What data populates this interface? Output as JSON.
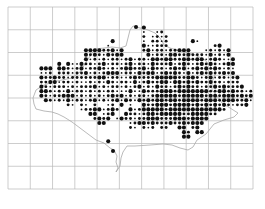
{
  "map": {
    "type": "tetrad-distribution-dot-map",
    "grid": {
      "left": 8,
      "top": 7,
      "right": 253,
      "bottom": 189,
      "columns": 11,
      "rows": 8,
      "line_color": "#b8b8b8",
      "subdivisions_per_square": 5
    },
    "outline_color": "#a8a8a8",
    "dot_color": "#111111",
    "dot_sizes": {
      "s": 0.9,
      "m": 1.45,
      "l": 2.05
    },
    "dot_origin_row": 4,
    "dot_rows": [
      "..............................l.........................",
      "..............................s..sm.....................",
      "..............................m.smsm....................",
      ".......................l......s.mmsm.....ls.............",
      "......................s.......lssmmm..........ml........",
      ".................llllmmlsl....mlsmmsmmlll...smsmsl......",
      ".................lmlmslmll.....lsmmsllmmlmmmslsmsl......",
      ".................lsmsmsmmsmlsmmsllmllmmllmllsmlmssl.....",
      "...........l.lsslmmsmlsmmsmlsmmslmmmlsmlmsmlmlmsmll.....",
      ".......lll.llmsmlsmmlmsmsmllmmlslmmsmlmlsmlmlmlmsms.....",
      ".......ssm.mmmsmmlsmsmlllsmmslmllsmlmlmslsmlmlmmlml.....",
      ".......lmmlmmsmmmmmmllsmmssmlmmmmlllllmmllmsmlsmmsml....",
      ".......mmllsmmsmssmsmslmsmmslsmlmmllsllmlmlmmlmmsmmm....",
      ".......lmsmmmsmsmmmlsmsmmsmsmlsmslmmsmlmlmmsmmlmlmmml...",
      ".......llmsmslsmmsmsmsmmssslsslmmmlllmlllllllmmllmlmmsm.",
      ".......lmsmmlllsmsmsmsmlmlsmsmmsmlllllmlllllmllmlllmlml.",
      "........lmsmslsmmsmlsmsmlslmslmlmllmllmllllmlllmlllmmls.",
      ".............ms.ms.m..sm.l.s..lmmlllmllllmlmlmlmlmsmml..",
      "................smmllsmlm..lsmlllllmllllllllllllm.......",
      "..................ll.sml..lmmsmllmlllllmmllllmm.........",
      "...................mlml.slmmsmmlllmmmlllmllll...........",
      "....................ll.....smllmlmmmlmmlmlll............",
      "...........................ms.msm.mm..ll.ml.............",
      ".......................................lm.ll............",
      ".......................................ll...............",
      "......................l..............................."
    ],
    "outline_points": [
      [
        36,
        109
      ],
      [
        44,
        111
      ],
      [
        52,
        112
      ],
      [
        58,
        114
      ],
      [
        64,
        117
      ],
      [
        72,
        122
      ],
      [
        80,
        128
      ],
      [
        88,
        134
      ],
      [
        96,
        140
      ],
      [
        104,
        143
      ],
      [
        110,
        148
      ],
      [
        114,
        150
      ],
      [
        117,
        156
      ],
      [
        116,
        162
      ],
      [
        118,
        168
      ],
      [
        116,
        172
      ],
      [
        120,
        166
      ],
      [
        121,
        158
      ],
      [
        123,
        152
      ],
      [
        127,
        146
      ],
      [
        135,
        146
      ],
      [
        150,
        145
      ],
      [
        163,
        144
      ],
      [
        172,
        145
      ],
      [
        180,
        148
      ],
      [
        188,
        150
      ],
      [
        193,
        147
      ],
      [
        197,
        140
      ],
      [
        206,
        134
      ],
      [
        214,
        124
      ],
      [
        224,
        120
      ],
      [
        234,
        117
      ],
      [
        238,
        113
      ],
      [
        230,
        108
      ],
      [
        222,
        103
      ],
      [
        217,
        96
      ],
      [
        212,
        90
      ],
      [
        212,
        82
      ],
      [
        216,
        72
      ],
      [
        210,
        66
      ],
      [
        205,
        60
      ],
      [
        195,
        55
      ],
      [
        185,
        52
      ],
      [
        177,
        50
      ],
      [
        170,
        48
      ],
      [
        164,
        45
      ],
      [
        160,
        38
      ],
      [
        155,
        33
      ],
      [
        148,
        30
      ],
      [
        140,
        28
      ],
      [
        133,
        26
      ],
      [
        130,
        30
      ],
      [
        128,
        38
      ],
      [
        126,
        46
      ],
      [
        120,
        48
      ],
      [
        112,
        47
      ],
      [
        104,
        48
      ],
      [
        95,
        49
      ],
      [
        90,
        56
      ],
      [
        85,
        64
      ],
      [
        80,
        72
      ],
      [
        72,
        78
      ],
      [
        62,
        80
      ],
      [
        52,
        82
      ],
      [
        42,
        86
      ],
      [
        36,
        90
      ],
      [
        33,
        98
      ],
      [
        34,
        104
      ],
      [
        36,
        109
      ]
    ],
    "isolated_dots": [
      {
        "x": 113,
        "y": 151,
        "size": "l"
      },
      {
        "x": 136,
        "y": 27,
        "size": "l"
      }
    ]
  }
}
